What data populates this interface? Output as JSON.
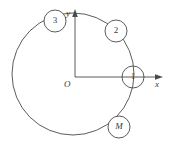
{
  "figure": {
    "name": "orbit-diagram",
    "background_color": "#ffffff",
    "stroke_color": "#4a4a4a"
  },
  "axes": {
    "origin_label": "O",
    "x_axis_label": "x",
    "y_axis_label": "y",
    "origin_px": {
      "x": 75,
      "y": 77
    },
    "x_axis_end_px": {
      "x": 163,
      "y": 77
    },
    "y_axis_end_px": {
      "x": 75,
      "y": 12
    }
  },
  "orbit": {
    "label": "large-circle",
    "center_px": {
      "x": 73,
      "y": 74
    },
    "radius_px": 61
  },
  "nodes": [
    {
      "id": "node-1",
      "label": "1",
      "italic": false,
      "cx": 133,
      "cy": 77,
      "r": 11
    },
    {
      "id": "node-2",
      "label": "2",
      "italic": false,
      "cx": 116,
      "cy": 31,
      "r": 11
    },
    {
      "id": "node-3",
      "label": "3",
      "italic": false,
      "cx": 55,
      "cy": 21,
      "r": 11
    },
    {
      "id": "node-m",
      "label": "M",
      "italic": true,
      "cx": 119,
      "cy": 127,
      "r": 11
    }
  ]
}
